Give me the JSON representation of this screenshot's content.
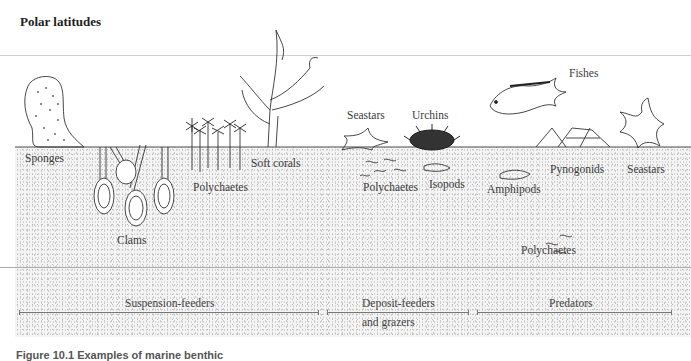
{
  "title": "Polar latitudes",
  "organisms": {
    "sponges": "Sponges",
    "clams": "Clams",
    "polychaetes_1": "Polychaetes",
    "soft_corals": "Soft corals",
    "seastars_1": "Seastars",
    "urchins": "Urchins",
    "polychaetes_2": "Polychaetes",
    "isopods": "Isopods",
    "fishes": "Fishes",
    "amphipods": "Amphipods",
    "pynogonids": "Pynogonids",
    "seastars_2": "Seastars",
    "polychaetes_3": "Polychaetes"
  },
  "feeding_groups": {
    "suspension": "Suspension-feeders",
    "deposit_line1": "Deposit-feeders",
    "deposit_line2": "and grazers",
    "predators": "Predators"
  },
  "caption": "Figure 10.1  Examples of marine benthic"
}
